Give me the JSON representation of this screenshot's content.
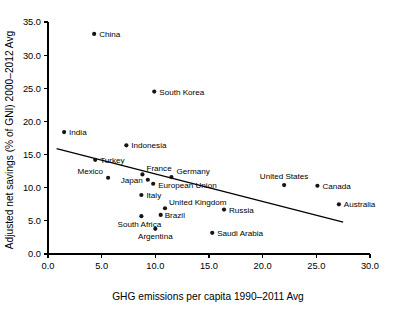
{
  "chart_data": {
    "type": "scatter",
    "title": "",
    "xlabel": "GHG emissions per capita 1990–2011 Avg",
    "ylabel": "Adjusted net savings (% of GNI) 2000–2012 Avg",
    "xlim": [
      0.0,
      30.0
    ],
    "ylim": [
      0.0,
      35.0
    ],
    "grid": false,
    "legend": "none",
    "xticks": [
      "0.0",
      "5.0",
      "10.0",
      "15.0",
      "20.0",
      "25.0",
      "30.0"
    ],
    "xtick_values": [
      0.0,
      5.0,
      10.0,
      15.0,
      20.0,
      25.0,
      30.0
    ],
    "yticks": [
      "0.0",
      "5.0",
      "10.0",
      "15.0",
      "20.0",
      "25.0",
      "30.0",
      "35.0"
    ],
    "ytick_values": [
      0.0,
      5.0,
      10.0,
      15.0,
      20.0,
      25.0,
      30.0,
      35.0
    ],
    "marker_color": "#151515",
    "line_color": "#000000",
    "points": [
      {
        "label": "China",
        "x": 4.3,
        "y": 33.2,
        "anchor": "right",
        "dx": 5,
        "dy": 3
      },
      {
        "label": "South Korea",
        "x": 9.9,
        "y": 24.5,
        "anchor": "right",
        "dx": 5,
        "dy": 3
      },
      {
        "label": "India",
        "x": 1.5,
        "y": 18.4,
        "anchor": "right",
        "dx": 5,
        "dy": 3
      },
      {
        "label": "Indonesia",
        "x": 7.3,
        "y": 16.4,
        "anchor": "right",
        "dx": 5,
        "dy": 3
      },
      {
        "label": "Turkey",
        "x": 4.4,
        "y": 14.2,
        "anchor": "right",
        "dx": 5,
        "dy": 3
      },
      {
        "label": "Mexico",
        "x": 5.6,
        "y": 11.5,
        "anchor": "left",
        "dx": -5,
        "dy": -4
      },
      {
        "label": "France",
        "x": 8.8,
        "y": 12.0,
        "anchor": "right",
        "dx": 4,
        "dy": -3
      },
      {
        "label": "Germany",
        "x": 11.5,
        "y": 11.6,
        "anchor": "right",
        "dx": 5,
        "dy": -3
      },
      {
        "label": "Japan",
        "x": 9.3,
        "y": 11.2,
        "anchor": "left",
        "dx": -5,
        "dy": 3
      },
      {
        "label": "European Union",
        "x": 9.8,
        "y": 10.6,
        "anchor": "right",
        "dx": 5,
        "dy": 4
      },
      {
        "label": "United States",
        "x": 22.0,
        "y": 10.4,
        "anchor": "center",
        "dx": 0,
        "dy": -6
      },
      {
        "label": "Canada",
        "x": 25.1,
        "y": 10.3,
        "anchor": "right",
        "dx": 5,
        "dy": 3
      },
      {
        "label": "Italy",
        "x": 8.7,
        "y": 8.9,
        "anchor": "right",
        "dx": 5,
        "dy": 3
      },
      {
        "label": "Australia",
        "x": 27.1,
        "y": 7.5,
        "anchor": "right",
        "dx": 5,
        "dy": 3
      },
      {
        "label": "United Kingdom",
        "x": 10.9,
        "y": 6.9,
        "anchor": "right",
        "dx": 4,
        "dy": -3
      },
      {
        "label": "Russia",
        "x": 16.4,
        "y": 6.7,
        "anchor": "right",
        "dx": 5,
        "dy": 3
      },
      {
        "label": "Brazil",
        "x": 10.5,
        "y": 5.9,
        "anchor": "right",
        "dx": 4,
        "dy": 3
      },
      {
        "label": "South Africa",
        "x": 8.7,
        "y": 5.7,
        "anchor": "center",
        "dx": -2,
        "dy": 11
      },
      {
        "label": "Argentina",
        "x": 10.0,
        "y": 3.8,
        "anchor": "center",
        "dx": 0,
        "dy": 10
      },
      {
        "label": "Saudi Arabia",
        "x": 15.3,
        "y": 3.2,
        "anchor": "right",
        "dx": 5,
        "dy": 3
      }
    ],
    "trend_line": {
      "x0": 0.8,
      "y0": 15.9,
      "x1": 27.5,
      "y1": 4.8
    }
  }
}
